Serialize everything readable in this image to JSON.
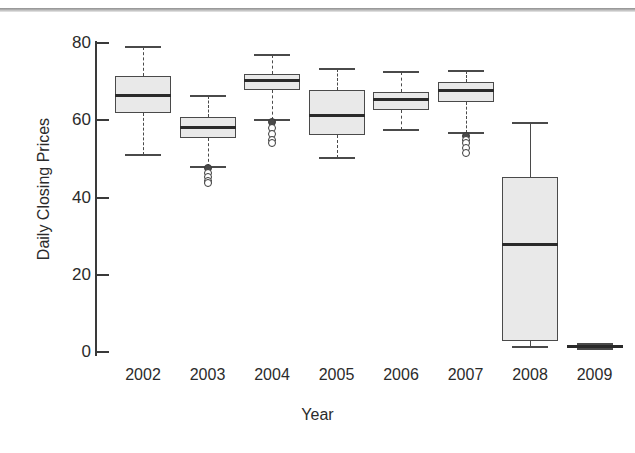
{
  "chart_data": {
    "type": "box",
    "title": "",
    "xlabel": "Year",
    "ylabel": "Daily Closing Prices",
    "categories": [
      "2002",
      "2003",
      "2004",
      "2005",
      "2006",
      "2007",
      "2008",
      "2009"
    ],
    "ylim": [
      0,
      84
    ],
    "yticks": [
      0,
      20,
      40,
      60,
      80
    ],
    "ytick_labels": [
      "0",
      "20",
      "40",
      "60",
      "80"
    ],
    "grid": false,
    "legend": "none",
    "boxes": [
      {
        "category": "2002",
        "whisker_low": 51.0,
        "q1": 62.0,
        "median": 66.5,
        "q3": 71.5,
        "whisker_high": 79.0,
        "outliers": [],
        "whisker_style": "dashed"
      },
      {
        "category": "2003",
        "whisker_low": 48.0,
        "q1": 55.5,
        "median": 58.0,
        "q3": 60.8,
        "whisker_high": 66.3,
        "outliers": [
          47.6,
          46.3,
          45.2,
          44.2,
          43.7
        ],
        "whisker_style": "dashed"
      },
      {
        "category": "2004",
        "whisker_low": 60.0,
        "q1": 67.8,
        "median": 70.4,
        "q3": 71.9,
        "whisker_high": 77.0,
        "outliers": [
          59.6,
          57.9,
          56.4,
          55.0,
          54.0
        ],
        "whisker_style": "dashed"
      },
      {
        "category": "2005",
        "whisker_low": 50.2,
        "q1": 56.3,
        "median": 61.2,
        "q3": 67.8,
        "whisker_high": 73.2,
        "outliers": [],
        "whisker_style": "dashed"
      },
      {
        "category": "2006",
        "whisker_low": 57.5,
        "q1": 62.6,
        "median": 65.4,
        "q3": 67.3,
        "whisker_high": 72.4,
        "outliers": [],
        "whisker_style": "dashed"
      },
      {
        "category": "2007",
        "whisker_low": 56.6,
        "q1": 64.6,
        "median": 67.8,
        "q3": 69.8,
        "whisker_high": 72.7,
        "outliers": [
          56.0,
          55.0,
          54.0,
          52.8,
          51.5
        ],
        "whisker_style": "dashed"
      },
      {
        "category": "2008",
        "whisker_low": 1.4,
        "q1": 2.8,
        "median": 27.8,
        "q3": 45.2,
        "whisker_high": 59.3,
        "outliers": [],
        "whisker_style": "solid"
      },
      {
        "category": "2009",
        "whisker_low": 0.9,
        "q1": 1.1,
        "median": 1.5,
        "q3": 1.9,
        "whisker_high": 2.1,
        "outliers": [],
        "whisker_style": "solid"
      }
    ]
  },
  "style": {
    "box_fill": "#e9e9e9",
    "box_stroke": "#4a4a4a",
    "median_color": "#2a2a2a",
    "axis_color": "#3a3a3a",
    "text_color": "#2b2b2b",
    "background": "#ffffff"
  }
}
